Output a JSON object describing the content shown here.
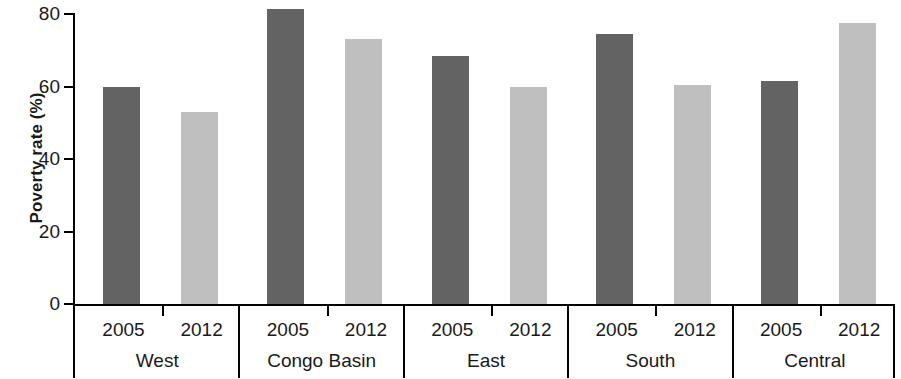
{
  "chart_data": {
    "type": "bar",
    "title": "",
    "subtitle": "",
    "xlabel": "",
    "ylabel": "Poverty rate (%)",
    "ylim": [
      0,
      80
    ],
    "yticks": [
      0,
      20,
      40,
      60,
      80
    ],
    "ytick_labels": [
      "0",
      "20",
      "40",
      "60",
      "80"
    ],
    "grid": false,
    "legend_position": "none",
    "categories": [
      "West",
      "Congo Basin",
      "East",
      "South",
      "Central"
    ],
    "subcategories": [
      "2005",
      "2012"
    ],
    "series": [
      {
        "name": "2005",
        "color": "#636363",
        "values": [
          60.0,
          81.5,
          68.5,
          74.5,
          61.5
        ]
      },
      {
        "name": "2012",
        "color": "#bfbfbf",
        "values": [
          53.0,
          73.0,
          60.0,
          60.5,
          77.5
        ]
      }
    ],
    "bars": [
      {
        "group": "West",
        "year": "2005",
        "value": 60.0,
        "style": "dark"
      },
      {
        "group": "West",
        "year": "2012",
        "value": 53.0,
        "style": "light"
      },
      {
        "group": "Congo Basin",
        "year": "2005",
        "value": 81.5,
        "style": "dark"
      },
      {
        "group": "Congo Basin",
        "year": "2012",
        "value": 73.0,
        "style": "light"
      },
      {
        "group": "East",
        "year": "2005",
        "value": 68.5,
        "style": "dark"
      },
      {
        "group": "East",
        "year": "2012",
        "value": 60.0,
        "style": "light"
      },
      {
        "group": "South",
        "year": "2005",
        "value": 74.5,
        "style": "dark"
      },
      {
        "group": "South",
        "year": "2012",
        "value": 60.5,
        "style": "light"
      },
      {
        "group": "Central",
        "year": "2005",
        "value": 61.5,
        "style": "dark"
      },
      {
        "group": "Central",
        "year": "2012",
        "value": 77.5,
        "style": "light"
      }
    ]
  },
  "axes": {
    "y": {
      "title": "Poverty rate (%)",
      "ticks": [
        {
          "label": "80",
          "value": 80
        },
        {
          "label": "60",
          "value": 60
        },
        {
          "label": "40",
          "value": 40
        },
        {
          "label": "20",
          "value": 20
        },
        {
          "label": "0",
          "value": 0
        }
      ]
    },
    "x": {
      "groups": [
        {
          "label": "West",
          "years": [
            "2005",
            "2012"
          ]
        },
        {
          "label": "Congo Basin",
          "years": [
            "2005",
            "2012"
          ]
        },
        {
          "label": "East",
          "years": [
            "2005",
            "2012"
          ]
        },
        {
          "label": "South",
          "years": [
            "2005",
            "2012"
          ]
        },
        {
          "label": "Central",
          "years": [
            "2005",
            "2012"
          ]
        }
      ]
    }
  },
  "colors": {
    "bar_2005": "#636363",
    "bar_2012": "#bfbfbf",
    "axis": "#000000",
    "text": "#1a1a1a",
    "background": "#ffffff"
  }
}
